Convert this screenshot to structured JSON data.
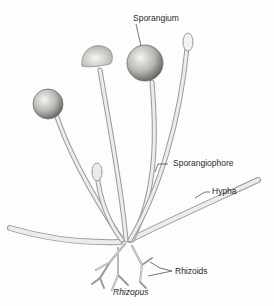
{
  "diagram": {
    "title": "Rhizopus",
    "labels": {
      "sporangium": "Sporangium",
      "sporangiophore": "Sporangiophore",
      "hypha": "Hypha",
      "rhizoids": "Rhizoids"
    },
    "caption": "Rhizopus",
    "colors": {
      "stalk_fill": "#e9e9e6",
      "stalk_stroke": "#9a9a96",
      "sphere_dark": "#6d6d6a",
      "sphere_light": "#f2f2ef",
      "text": "#2a2a2a",
      "leader": "#3a3a3a"
    }
  }
}
